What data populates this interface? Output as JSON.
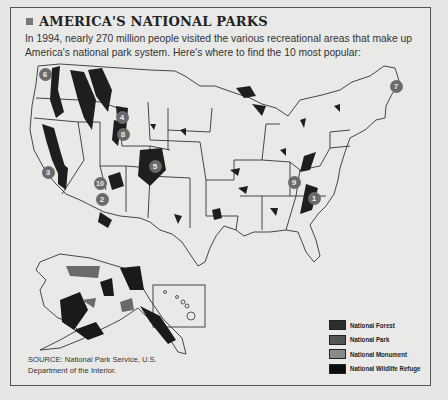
{
  "header": {
    "title": "AMERICA'S NATIONAL PARKS",
    "intro": "In 1994, nearly 270 million people visited the various recreational areas that make up America's national park system. Here's where to find the 10 most popular:"
  },
  "map": {
    "markers": [
      {
        "label": "1",
        "x": 314,
        "y": 198
      },
      {
        "label": "2",
        "x": 102,
        "y": 199
      },
      {
        "label": "3",
        "x": 48,
        "y": 172
      },
      {
        "label": "4",
        "x": 122,
        "y": 117
      },
      {
        "label": "5",
        "x": 155,
        "y": 166
      },
      {
        "label": "6",
        "x": 45,
        "y": 74
      },
      {
        "label": "7",
        "x": 396,
        "y": 86
      },
      {
        "label": "8",
        "x": 123,
        "y": 134
      },
      {
        "label": "9",
        "x": 294,
        "y": 182
      },
      {
        "label": "10",
        "x": 100,
        "y": 183
      }
    ]
  },
  "legend": {
    "items": [
      {
        "label": "National Forest",
        "color": "#2e2e2e"
      },
      {
        "label": "National Park",
        "color": "#555555"
      },
      {
        "label": "National Monument",
        "color": "#8a8a8a"
      },
      {
        "label": "National Wildlife Refuge",
        "color": "#0c0c0c"
      }
    ]
  },
  "source": "SOURCE: National Park Service, U.S. Department of the Interior."
}
